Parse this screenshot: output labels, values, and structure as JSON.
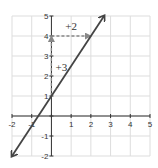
{
  "chart_data": {
    "type": "line",
    "title": "",
    "xlabel": "",
    "ylabel": "",
    "xlim": [
      -2,
      5
    ],
    "ylim": [
      -2,
      5
    ],
    "grid": true,
    "x_ticks": [
      "-2",
      "-1",
      "",
      "1",
      "2",
      "3",
      "4",
      "5"
    ],
    "y_ticks": [
      "-2",
      "-1",
      "",
      "1",
      "2",
      "3",
      "4",
      "5"
    ],
    "series": [
      {
        "name": "y = 1.5x + 1",
        "slope": 1.5,
        "intercept": 1,
        "x": [
          -2,
          2.67
        ],
        "y": [
          -2,
          5
        ],
        "arrows_both_ends": true
      }
    ],
    "annotations": [
      {
        "type": "dashed-arrow",
        "from": [
          0,
          1
        ],
        "to": [
          0,
          4
        ],
        "label": "+3"
      },
      {
        "type": "dashed-arrow",
        "from": [
          0,
          4
        ],
        "to": [
          2,
          4
        ],
        "label": "+2"
      }
    ],
    "colors": {
      "line": "#444444",
      "dashed": "#888888",
      "grid": "#dddddd",
      "axis": "#333333"
    }
  }
}
